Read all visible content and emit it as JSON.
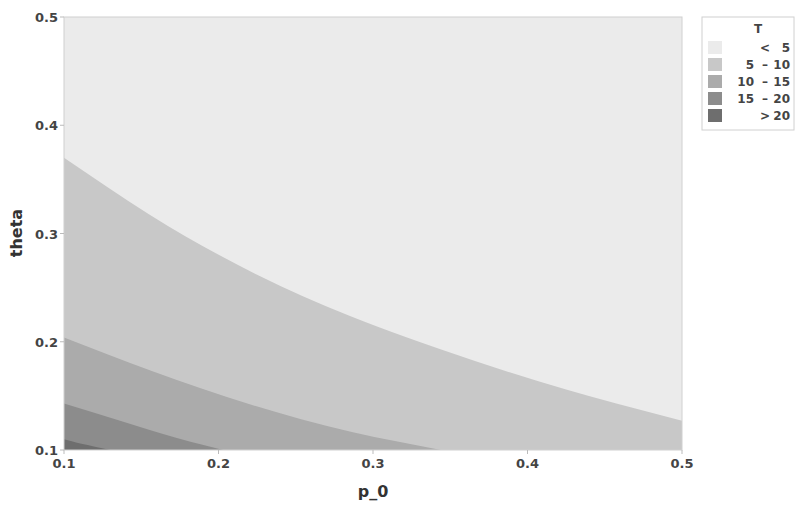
{
  "chart_data": {
    "type": "heatmap",
    "subtype": "filled-contour",
    "title": "",
    "xlabel": "p_0",
    "ylabel": "theta",
    "xlim": [
      0.1,
      0.5
    ],
    "ylim": [
      0.1,
      0.5
    ],
    "x_ticks": [
      "0.1",
      "0.2",
      "0.3",
      "0.4",
      "0.5"
    ],
    "y_ticks": [
      "0.1",
      "0.2",
      "0.3",
      "0.4",
      "0.5"
    ],
    "grid": false,
    "legend_position": "right",
    "legend_title": "T",
    "levels": [
      {
        "label": "< 5",
        "lo_text": "",
        "sep": "<",
        "hi_text": "5",
        "color": "#ebebeb"
      },
      {
        "label": "5 - 10",
        "lo_text": "5",
        "sep": "–",
        "hi_text": "10",
        "color": "#c8c8c8"
      },
      {
        "label": "10 - 15",
        "lo_text": "10",
        "sep": "–",
        "hi_text": "15",
        "color": "#ababab"
      },
      {
        "label": "15 - 20",
        "lo_text": "15",
        "sep": "–",
        "hi_text": "20",
        "color": "#8c8c8c"
      },
      {
        "label": "> 20",
        "lo_text": "",
        "sep": ">",
        "hi_text": "20",
        "color": "#6e6e6e"
      }
    ],
    "contours": [
      {
        "level": 5,
        "points": [
          [
            0.1,
            0.37
          ],
          [
            0.156,
            0.316
          ],
          [
            0.201,
            0.279
          ],
          [
            0.253,
            0.242
          ],
          [
            0.318,
            0.205
          ],
          [
            0.415,
            0.159
          ],
          [
            0.5,
            0.127
          ]
        ]
      },
      {
        "level": 10,
        "points": [
          [
            0.1,
            0.204
          ],
          [
            0.156,
            0.173
          ],
          [
            0.221,
            0.141
          ],
          [
            0.286,
            0.116
          ],
          [
            0.344,
            0.1
          ]
        ]
      },
      {
        "level": 15,
        "points": [
          [
            0.1,
            0.143
          ],
          [
            0.136,
            0.127
          ],
          [
            0.175,
            0.11
          ],
          [
            0.203,
            0.1
          ]
        ]
      },
      {
        "level": 20,
        "points": [
          [
            0.1,
            0.11
          ],
          [
            0.11,
            0.106
          ],
          [
            0.13,
            0.1
          ]
        ]
      }
    ]
  }
}
